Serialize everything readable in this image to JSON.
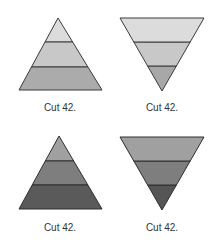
{
  "figures": [
    {
      "id": "pyramid-light",
      "orientation": "up",
      "label": "Cut 42.",
      "outline": "#3a3a3a",
      "apex": [
        58,
        18
      ],
      "base": [
        [
          19,
          90
        ],
        [
          102,
          90
        ]
      ],
      "dividers_y": [
        42,
        67
      ],
      "band_colors": [
        "#dcdcdc",
        "#c8c8c8",
        "#ababab"
      ],
      "label_pos": [
        30,
        102
      ]
    },
    {
      "id": "inverted-light",
      "orientation": "down",
      "label": "Cut 42.",
      "outline": "#3a3a3a",
      "apex": [
        162,
        91
      ],
      "base": [
        [
          120,
          18
        ],
        [
          204,
          18
        ]
      ],
      "dividers_y": [
        42,
        66
      ],
      "band_colors": [
        "#dcdcdc",
        "#c8c8c8",
        "#a8a8a8"
      ],
      "label_pos": [
        132,
        102
      ]
    },
    {
      "id": "pyramid-dark",
      "orientation": "up",
      "label": "Cut 42.",
      "outline": "#2e2e2e",
      "apex": [
        59,
        136
      ],
      "base": [
        [
          19,
          209
        ],
        [
          102,
          209
        ]
      ],
      "dividers_y": [
        161,
        185
      ],
      "band_colors": [
        "#a0a0a0",
        "#7e7e7e",
        "#5a5a5a"
      ],
      "label_pos": [
        30,
        222
      ]
    },
    {
      "id": "inverted-dark",
      "orientation": "down",
      "label": "Cut 42.",
      "outline": "#2e2e2e",
      "apex": [
        162,
        210
      ],
      "base": [
        [
          120,
          137
        ],
        [
          204,
          137
        ]
      ],
      "dividers_y": [
        161,
        185
      ],
      "band_colors": [
        "#a0a0a0",
        "#7e7e7e",
        "#555555"
      ],
      "label_pos": [
        132,
        222
      ]
    }
  ]
}
